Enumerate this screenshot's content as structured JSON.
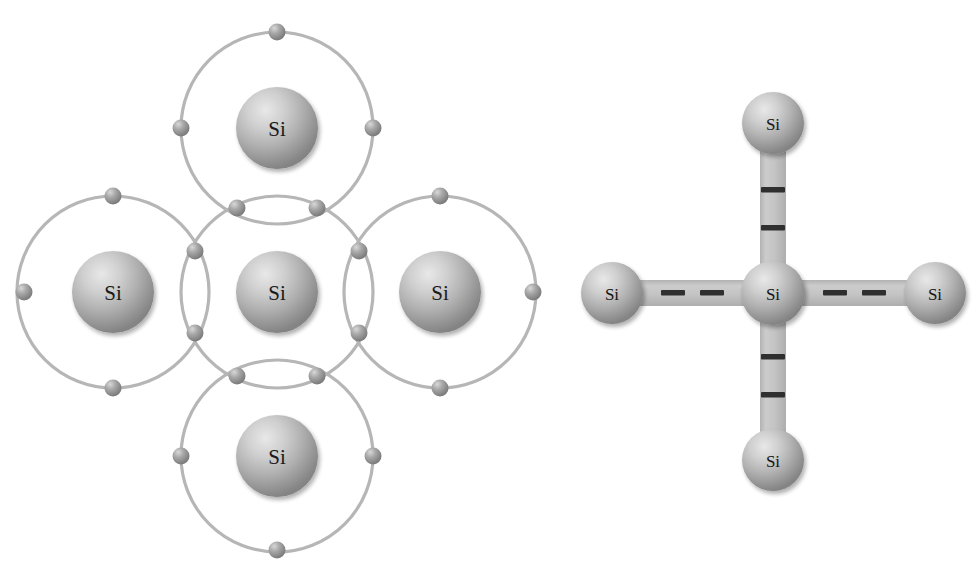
{
  "figure": {
    "background_color": "#ffffff",
    "atom_symbol": "Si",
    "orbital_color": "#b4b4b4",
    "electron_color": "#8c8c8c",
    "sphere_color": "#a8a8a8",
    "bond_color": "#c0c0c0",
    "dash_color": "#2b2b2b"
  },
  "panels": [
    {
      "name": "shared-electron-model",
      "caption": "",
      "atoms": [
        {
          "label": "Si",
          "position": "center",
          "cx": 277,
          "cy": 292,
          "r_sphere": 41,
          "r_orbit": 115
        },
        {
          "label": "Si",
          "position": "top",
          "cx": 277,
          "cy": 128,
          "r_sphere": 41,
          "r_orbit": 115
        },
        {
          "label": "Si",
          "position": "left",
          "cx": 113,
          "cy": 292,
          "r_sphere": 41,
          "r_orbit": 115
        },
        {
          "label": "Si",
          "position": "right",
          "cx": 440,
          "cy": 292,
          "r_sphere": 41,
          "r_orbit": 115
        },
        {
          "label": "Si",
          "position": "bottom",
          "cx": 277,
          "cy": 456,
          "r_sphere": 41,
          "r_orbit": 115
        }
      ],
      "shared_electron_pairs": [
        {
          "bond": "center-top",
          "electrons": [
            {
              "cx": 237,
              "cy": 208
            },
            {
              "cx": 317,
              "cy": 208
            }
          ]
        },
        {
          "bond": "center-bottom",
          "electrons": [
            {
              "cx": 237,
              "cy": 376
            },
            {
              "cx": 317,
              "cy": 376
            }
          ]
        },
        {
          "bond": "center-left",
          "electrons": [
            {
              "cx": 195,
              "cy": 251
            },
            {
              "cx": 195,
              "cy": 333
            }
          ]
        },
        {
          "bond": "center-right",
          "electrons": [
            {
              "cx": 359,
              "cy": 251
            },
            {
              "cx": 359,
              "cy": 333
            }
          ]
        }
      ],
      "outer_electrons": [
        {
          "atom": "top",
          "cx": 277,
          "cy": 32,
          "direction": "up"
        },
        {
          "atom": "top",
          "cx": 181,
          "cy": 128,
          "direction": "left"
        },
        {
          "atom": "top",
          "cx": 373,
          "cy": 128,
          "direction": "right"
        },
        {
          "atom": "left",
          "cx": 113,
          "cy": 196,
          "direction": "up"
        },
        {
          "atom": "left",
          "cx": 24,
          "cy": 292,
          "direction": "left"
        },
        {
          "atom": "left",
          "cx": 113,
          "cy": 388,
          "direction": "down"
        },
        {
          "atom": "right",
          "cx": 440,
          "cy": 196,
          "direction": "up"
        },
        {
          "atom": "right",
          "cx": 533,
          "cy": 292,
          "direction": "right"
        },
        {
          "atom": "right",
          "cx": 440,
          "cy": 388,
          "direction": "down"
        },
        {
          "atom": "bottom",
          "cx": 181,
          "cy": 456,
          "direction": "left"
        },
        {
          "atom": "bottom",
          "cx": 373,
          "cy": 456,
          "direction": "right"
        },
        {
          "atom": "bottom",
          "cx": 277,
          "cy": 550,
          "direction": "down"
        }
      ],
      "electron_radius": 8
    },
    {
      "name": "covalent-bond-model",
      "caption": "",
      "atoms": [
        {
          "label": "Si",
          "position": "center",
          "cx": 773,
          "cy": 293,
          "r_sphere": 32
        },
        {
          "label": "Si",
          "position": "top",
          "cx": 773,
          "cy": 123,
          "r_sphere": 31
        },
        {
          "label": "Si",
          "position": "left",
          "cx": 612,
          "cy": 293,
          "r_sphere": 31
        },
        {
          "label": "Si",
          "position": "right",
          "cx": 935,
          "cy": 293,
          "r_sphere": 31
        },
        {
          "label": "Si",
          "position": "bottom",
          "cx": 773,
          "cy": 460,
          "r_sphere": 31
        }
      ],
      "bonds": [
        {
          "from": "center",
          "to": "top",
          "orientation": "vertical",
          "dashes": 2
        },
        {
          "from": "center",
          "to": "bottom",
          "orientation": "vertical",
          "dashes": 2
        },
        {
          "from": "center",
          "to": "left",
          "orientation": "horizontal",
          "dashes": 2
        },
        {
          "from": "center",
          "to": "right",
          "orientation": "horizontal",
          "dashes": 2
        }
      ],
      "bond_width": 26
    }
  ]
}
